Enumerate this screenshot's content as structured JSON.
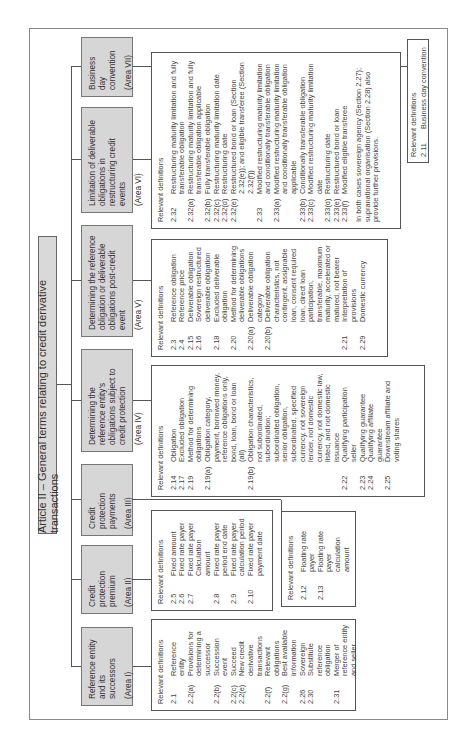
{
  "title": "Article II – General terms relating to credit derivative transactions",
  "relevant_heading": "Relevant definitions",
  "areas": [
    {
      "name": "Reference entity and its successors",
      "area": "(Area I)",
      "definitions": [
        {
          "num": "2.1",
          "text": "Reference entity"
        },
        {
          "num": "2.2(a)",
          "text": "Provisions for determining a successor"
        },
        {
          "num": "2.2(b)",
          "text": "Succession event"
        },
        {
          "num": "2.2(c)",
          "text": "Succeed"
        },
        {
          "num": "2.2(e)",
          "text": "New credit derivative transactions"
        },
        {
          "num": "2.2(f)",
          "text": "Relevant obligations"
        },
        {
          "num": "2.2(g)",
          "text": "Best available information"
        },
        {
          "num": "2.26",
          "text": "Sovereign"
        },
        {
          "num": "2.30",
          "text": "Substitute reference obligation"
        },
        {
          "num": "2.31",
          "text": "Merger of reference entity and seller"
        }
      ]
    },
    {
      "name": "Credit protection premium",
      "area": "(Area II)",
      "definitions": [
        {
          "num": "2.5",
          "text": "Fixed amount"
        },
        {
          "num": "2.6",
          "text": "Fixed rate payer"
        },
        {
          "num": "2.7",
          "text": "Fixed rate payer Calculation amount"
        },
        {
          "num": "2.8",
          "text": "Fixed rate payer period end date"
        },
        {
          "num": "2.9",
          "text": "Fixed rate payer calculation period"
        },
        {
          "num": "2.10",
          "text": "Fixed rate payer payment date"
        }
      ]
    },
    {
      "name": "Credit protection payments",
      "area": "(Area III)",
      "definitions": [
        {
          "num": "2.12",
          "text": "Floating rate payer"
        },
        {
          "num": "2.13",
          "text": "Floating rate payer calculation amount"
        }
      ]
    },
    {
      "name": "Determining the reference entity's obligations subject to credit protection",
      "area": "(Area IV)",
      "definitions": [
        {
          "num": "2.14",
          "text": "Obligation"
        },
        {
          "num": "2.17",
          "text": "Excluded obligation"
        },
        {
          "num": "2.19",
          "text": "Method for determining obligations"
        },
        {
          "num": "2.19(a)",
          "text": "Obligation category, payment, borrowed money, reference obligations only, bond, loan, bond or loan (all)"
        },
        {
          "num": "2.19(b)",
          "text": "Obligation characteristics, not subordinated, subordination; subordinated obligation, senior obligation, subordinated, specified currency, not sovereign lender, not domestic currency, not domestic law, listed, and not domestic issuance"
        },
        {
          "num": "2.22",
          "text": "Qualifying participation seller"
        },
        {
          "num": "2.23",
          "text": "Qualifying guarantee"
        },
        {
          "num": "2.24",
          "text": "Qualifying affiliate guarantee"
        },
        {
          "num": "2.25",
          "text": "Downstream affiliate and voting shares"
        }
      ]
    },
    {
      "name": "Determining the reference obligation or deliverable obligations post-credit event",
      "area": "(Area V)",
      "definitions": [
        {
          "num": "2.3",
          "text": "Reference obligation"
        },
        {
          "num": "2.4",
          "text": "Reference price"
        },
        {
          "num": "2.15",
          "text": "Deliverable obligation"
        },
        {
          "num": "2.16",
          "text": "Sovereign restructured deliverable obligation"
        },
        {
          "num": "2.18",
          "text": "Excluded deliverable obligation"
        },
        {
          "num": "2.20",
          "text": "Method for determining deliverable obligations"
        },
        {
          "num": "2.20(a)",
          "text": "Deliverable obligation category"
        },
        {
          "num": "2.20(b)",
          "text": "Deliverable obligation characteristics, not contingent, assignable loan, consent required loan, direct loan participation, transferable, maximum maturity, accelerated or matured, not bearer"
        },
        {
          "num": "2.21",
          "text": "Interpretation of provisions"
        },
        {
          "num": "2.29",
          "text": "Domestic currency"
        }
      ]
    },
    {
      "name": "Limitation of deliverable obligations in restructuring credit events",
      "area": "(Area VI)",
      "definitions": [
        {
          "num": "2.32",
          "text": "Restructuring maturity limitation and fully transferable obligation"
        },
        {
          "num": "2.32(a)",
          "text": "Restructuring maturity limitation and fully transferable obligation applicable"
        },
        {
          "num": "2.32(b)",
          "text": "Fully transferable obligation"
        },
        {
          "num": "2.32(c)",
          "text": "Restructuring maturity limitation date"
        },
        {
          "num": "2.32(d)",
          "text": "Restructuring date"
        },
        {
          "num": "2.32(e)",
          "text": "Restructured bond or loan (Section 2.32(e)); and eligible transferee (Section 2.32(f))"
        },
        {
          "num": "2.33",
          "text": "Modified restructuring maturity limitation and conditionally transferable obligation"
        },
        {
          "num": "2.33(a)",
          "text": "Modified restructuring maturity limitation and conditionally transferable obligation applicable"
        },
        {
          "num": "2.33(b)",
          "text": "Conditionally transferable obligation"
        },
        {
          "num": "2.33(c)",
          "text": "Modified restructuring maturity limitation date"
        },
        {
          "num": "2.33(d)",
          "text": "Restructuring date"
        },
        {
          "num": "2.33(e)",
          "text": "Restructured bond or loan"
        },
        {
          "num": "2.33(f)",
          "text": "Modified eligible transferee"
        }
      ],
      "note": "In both cases sovereign agency (Section 2.27); supranational organisation (Section 2.28) also provide further provisions."
    },
    {
      "name": "Business day convention",
      "area": "(Area VII)",
      "definitions": [
        {
          "num": "2.11",
          "text": "Business day convention"
        }
      ]
    }
  ]
}
